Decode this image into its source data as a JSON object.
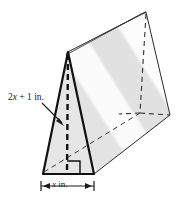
{
  "figure": {
    "name": "triangular-prism-diagram",
    "type": "geometric-solid",
    "solid": "triangular prism",
    "colors": {
      "outline": "#1a1a1a",
      "hidden_edge": "#3a3a3a",
      "face_front": "#e6e6e6",
      "face_side_light": "#fbfbfb",
      "face_side_gray": "#e2e2e2",
      "face_top": "#f2f2f2",
      "label_text": "#1a1a1a"
    },
    "labels": {
      "height": {
        "prefix": "2",
        "var": "x",
        "suffix": " + 1 in."
      },
      "width": {
        "prefix": "",
        "var": "x",
        "suffix": " in."
      }
    },
    "annotations": {
      "right_angle_marker": "right-angle-marker",
      "altitude": "dashed altitude line from apex to base",
      "leader_arrow": "arrow from height label to triangle face"
    },
    "geometry": {
      "front_apex": [
        68,
        52
      ],
      "front_base_left": [
        43,
        174
      ],
      "front_base_right": [
        94,
        174
      ],
      "back_apex": [
        146,
        12
      ],
      "back_base_right": [
        170,
        115
      ],
      "dimension_line_y": 186,
      "dimension_line_x1": 41,
      "dimension_line_x2": 94
    }
  }
}
